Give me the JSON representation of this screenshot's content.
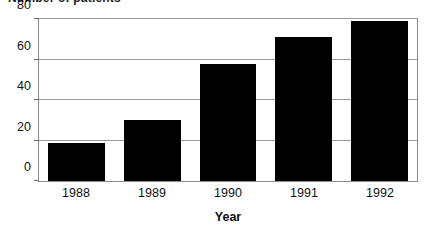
{
  "chart_data": {
    "type": "bar",
    "title": "Number of patients",
    "xlabel": "Year",
    "ylabel": "",
    "categories": [
      "1988",
      "1989",
      "1990",
      "1991",
      "1992"
    ],
    "values": [
      19,
      30,
      58,
      71,
      79
    ],
    "ylim": [
      0,
      80
    ],
    "yticks": [
      0,
      20,
      40,
      60,
      80
    ],
    "ytick_labels": [
      "0",
      "20",
      "40",
      "60",
      "80"
    ],
    "grid": true,
    "legend": null,
    "series_color": "#000000",
    "grid_color": "#9a9a9a",
    "frame_color": "#8a8a8a"
  }
}
